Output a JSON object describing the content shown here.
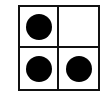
{
  "diagram": {
    "type": "2x2 grid",
    "rows": 2,
    "cols": 2,
    "cells": [
      {
        "row": 0,
        "col": 0,
        "filled": true
      },
      {
        "row": 0,
        "col": 1,
        "filled": false
      },
      {
        "row": 1,
        "col": 0,
        "filled": true
      },
      {
        "row": 1,
        "col": 1,
        "filled": true
      }
    ],
    "dot_count": 3,
    "colors": {
      "line": "#111111",
      "dot": "#000000",
      "background": "#ffffff"
    }
  }
}
